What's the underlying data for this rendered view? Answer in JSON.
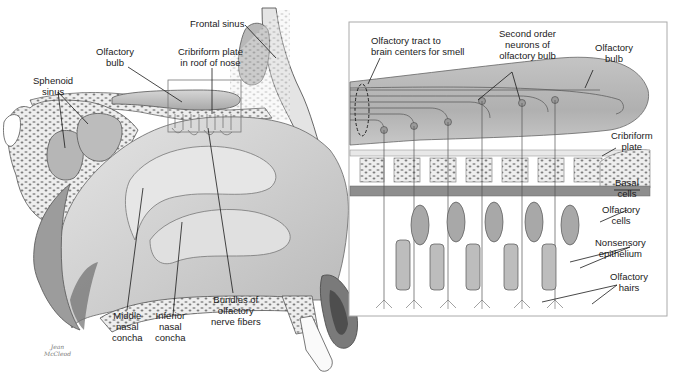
{
  "figure": {
    "panels": [
      {
        "id": "sagittal",
        "description": "Sagittal section of the nose showing nasal cavity"
      },
      {
        "id": "inset",
        "description": "Enlarged view of olfactory epithelium and olfactory bulb"
      }
    ]
  },
  "labels": {
    "sagittal": {
      "frontal_sinus": "Frontal sinus",
      "olfactory_bulb": "Olfactory\nbulb",
      "cribriform_plate": "Cribriform plate\nin roof of nose",
      "sphenoid_sinus": "Sphenoid\nsinus",
      "middle_concha": "Middle\nnasal\nconcha",
      "inferior_concha": "Inferior\nnasal\nconcha",
      "nerve_bundles": "Bundles of\nolfactory\nnerve fibers",
      "signature": "Jean\nMcCleod"
    },
    "inset": {
      "olfactory_tract": "Olfactory tract to\nbrain centers for smell",
      "second_order": "Second order\nneurons of\nolfactory bulb",
      "olfactory_bulb": "Olfactory\nbulb",
      "cribriform_plate": "Cribriform\nplate",
      "basal_cells": "Basal\ncells",
      "olfactory_cells": "Olfactory\ncells",
      "nonsensory": "Nonsensory\nepithelium",
      "olfactory_hairs": "Olfactory\nhairs"
    }
  },
  "colors": {
    "line": "#1a1a1a",
    "tissue_light": "#d8d8d8",
    "tissue_mid": "#b4b4b4",
    "tissue_dark": "#8a8a8a",
    "bone": "#ececec",
    "background": "#ffffff"
  }
}
